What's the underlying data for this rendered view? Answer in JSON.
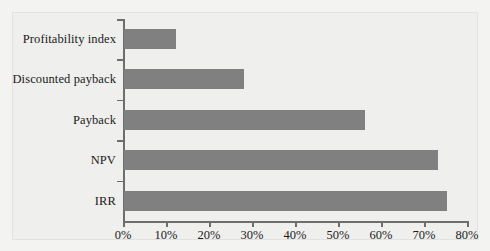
{
  "chart_data": {
    "type": "bar",
    "orientation": "horizontal",
    "title": "",
    "subtitle": "",
    "xlabel": "",
    "ylabel": "",
    "categories": [
      "Profitability index",
      "Discounted payback",
      "Payback",
      "NPV",
      "IRR"
    ],
    "values": [
      12,
      28,
      56,
      73,
      75
    ],
    "value_suffix": "%",
    "xlim": [
      0,
      80
    ],
    "x_ticks": [
      0,
      10,
      20,
      30,
      40,
      50,
      60,
      70,
      80
    ],
    "x_tick_labels": [
      "0%",
      "10%",
      "20%",
      "30%",
      "40%",
      "50%",
      "60%",
      "70%",
      "80%"
    ],
    "grid": false,
    "legend": false,
    "legend_position": "none",
    "series": [
      {
        "name": "Usage",
        "color": "#808080",
        "values": [
          12,
          28,
          56,
          73,
          75
        ]
      }
    ]
  },
  "colors": {
    "bar": "#808080",
    "axis": "#6e6e6e",
    "background": "#f3f3f1",
    "panel": "#efefed",
    "panel_border": "#e2e2e0",
    "text": "#1b1b1b"
  }
}
